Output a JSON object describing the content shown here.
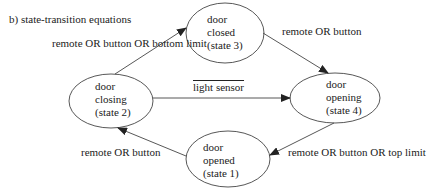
{
  "title": "b) state-transition equations",
  "states": [
    {
      "id": "s3",
      "line1": "door",
      "line2": "closed",
      "line3": "(state 3)"
    },
    {
      "id": "s2",
      "line1": "door",
      "line2": "closing",
      "line3": "(state 2)"
    },
    {
      "id": "s4",
      "line1": "door",
      "line2": "opening",
      "line3": "(state 4)"
    },
    {
      "id": "s1",
      "line1": "door",
      "line2": "opened",
      "line3": "(state 1)"
    }
  ],
  "transitions": [
    {
      "from": "state 2",
      "to": "state 3",
      "label": "remote OR button OR bottom limit"
    },
    {
      "from": "state 3",
      "to": "state 4",
      "label": "remote OR button"
    },
    {
      "from": "state 2",
      "to": "state 4",
      "label": "light sensor",
      "negated": true
    },
    {
      "from": "state 4",
      "to": "state 1",
      "label": "remote OR button OR top limit"
    },
    {
      "from": "state 1",
      "to": "state 2",
      "label": "remote OR button"
    }
  ],
  "colors": {
    "stroke": "#333333",
    "text": "#222222",
    "background": "#ffffff"
  }
}
